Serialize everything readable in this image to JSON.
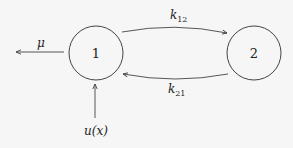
{
  "diagram": {
    "type": "compartment-model",
    "background": "#f6f6f6",
    "stroke_color": "#444444",
    "nodes": [
      {
        "id": "1",
        "label": "1",
        "cx": 96,
        "cy": 53,
        "r": 27
      },
      {
        "id": "2",
        "label": "2",
        "cx": 254,
        "cy": 53,
        "r": 27
      }
    ],
    "edges": [
      {
        "from": "1",
        "to": "2",
        "label_main": "k",
        "label_sub": "12"
      },
      {
        "from": "2",
        "to": "1",
        "label_main": "k",
        "label_sub": "21"
      },
      {
        "from": "1",
        "to": "out",
        "label": "μ"
      },
      {
        "from": "in",
        "to": "1",
        "label": "u(x)"
      }
    ]
  }
}
